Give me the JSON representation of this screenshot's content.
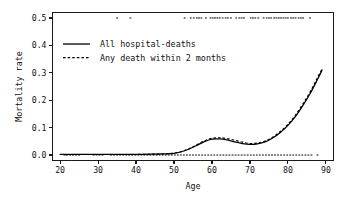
{
  "chart_data": {
    "type": "line",
    "title": "",
    "xlabel": "Age",
    "ylabel": "Mortality rate",
    "xlim": [
      18,
      92
    ],
    "ylim": [
      -0.02,
      0.52
    ],
    "xticks": [
      20,
      30,
      40,
      50,
      60,
      70,
      80,
      90
    ],
    "xtick_labels": [
      "20",
      "30",
      "40",
      "50",
      "60",
      "70",
      "80",
      "90"
    ],
    "yticks": [
      0.0,
      0.1,
      0.2,
      0.3,
      0.4,
      0.5
    ],
    "ytick_labels": [
      "0.0",
      "0.1",
      "0.2",
      "0.3",
      "0.4",
      "0.5"
    ],
    "grid": false,
    "frame": true,
    "legend_position": "upper-left",
    "series": [
      {
        "name": "All hospital-deaths",
        "style": "solid",
        "color": "#000000",
        "x": [
          20,
          24,
          28,
          32,
          36,
          40,
          44,
          47,
          50,
          52,
          54,
          56,
          58,
          60,
          62,
          64,
          66,
          68,
          70,
          72,
          74,
          76,
          78,
          80,
          82,
          84,
          86,
          88,
          89
        ],
        "y": [
          0.002,
          0.002,
          0.002,
          0.002,
          0.002,
          0.002,
          0.003,
          0.004,
          0.006,
          0.012,
          0.022,
          0.035,
          0.049,
          0.058,
          0.059,
          0.055,
          0.048,
          0.042,
          0.039,
          0.041,
          0.048,
          0.062,
          0.082,
          0.108,
          0.141,
          0.182,
          0.228,
          0.282,
          0.31
        ]
      },
      {
        "name": "Any death within 2 months",
        "style": "dashed",
        "color": "#000000",
        "x": [
          20,
          24,
          28,
          32,
          36,
          40,
          44,
          47,
          50,
          52,
          54,
          56,
          58,
          60,
          62,
          64,
          66,
          68,
          70,
          72,
          74,
          76,
          78,
          80,
          82,
          84,
          86,
          88,
          89
        ],
        "y": [
          0.002,
          0.002,
          0.002,
          0.002,
          0.002,
          0.002,
          0.003,
          0.004,
          0.007,
          0.013,
          0.023,
          0.037,
          0.052,
          0.061,
          0.063,
          0.06,
          0.054,
          0.047,
          0.042,
          0.044,
          0.051,
          0.065,
          0.086,
          0.112,
          0.146,
          0.188,
          0.234,
          0.288,
          0.314
        ]
      }
    ],
    "rug_top": {
      "y_value": 0.5,
      "description": "observations coded as events, plotted at y = 0.5",
      "x": [
        35.0,
        38.5,
        52.8,
        54.4,
        55.2,
        56.0,
        56.6,
        57.2,
        58.4,
        59.6,
        60.2,
        60.8,
        61.4,
        62.0,
        62.8,
        63.6,
        64.2,
        65.0,
        66.4,
        67.2,
        67.8,
        68.4,
        70.2,
        70.8,
        71.4,
        72.2,
        73.6,
        74.4,
        75.0,
        75.6,
        76.4,
        77.0,
        77.6,
        78.2,
        78.8,
        79.4,
        80.0,
        80.8,
        81.4,
        82.0,
        82.8,
        83.4,
        84.0,
        85.8
      ]
    },
    "rug_bottom": {
      "y_value": 0.0,
      "description": "observations coded as non-events, plotted at y = 0.0",
      "x": [
        21.2,
        21.8,
        22.6,
        23.4,
        24.2,
        25.0,
        28.8,
        29.6,
        30.4,
        31.2,
        33.4,
        34.2,
        35.0,
        35.8,
        36.6,
        37.4,
        38.2,
        39.0,
        39.8,
        40.6,
        41.4,
        42.2,
        43.0,
        43.8,
        44.6,
        45.4,
        46.2,
        47.0,
        47.8,
        48.6,
        49.4,
        50.2,
        51.0,
        51.8,
        52.6,
        53.4,
        54.2,
        55.0,
        55.8,
        56.6,
        57.4,
        58.2,
        59.0,
        59.8,
        60.6,
        61.4,
        62.2,
        63.0,
        63.8,
        64.6,
        65.4,
        66.2,
        67.0,
        67.8,
        68.6,
        69.4,
        70.2,
        71.0,
        71.8,
        72.6,
        73.4,
        74.2,
        75.0,
        75.8,
        76.6,
        77.4,
        78.2,
        79.0,
        79.8,
        80.6,
        81.4,
        82.2,
        83.0,
        83.8,
        84.6,
        85.4,
        86.2,
        87.8
      ]
    }
  },
  "legend": {
    "entries": [
      {
        "label": "All hospital-deaths",
        "style": "solid"
      },
      {
        "label": "Any death within 2 months",
        "style": "dashed"
      }
    ]
  }
}
